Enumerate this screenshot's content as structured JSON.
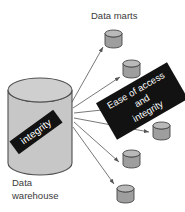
{
  "labels": {
    "data_marts": "Data marts",
    "warehouse_line1": "Data",
    "warehouse_line2": "warehouse"
  },
  "banners": {
    "warehouse_banner": "integrity",
    "flow_banner_line1": "Ease of access",
    "flow_banner_line2": "and",
    "flow_banner_line3": "integrity"
  },
  "colors": {
    "background": "#ffffff",
    "banner_bg": "#121212",
    "banner_text": "#ffffff",
    "warehouse_cylinder_fill": "#c7c7c7",
    "warehouse_cylinder_top": "#cfcfcf",
    "mart_cylinder_fill": "#9e9e9e",
    "mart_cylinder_top": "#b9b9b9",
    "outline": "#454545",
    "arrow": "#555555",
    "label_text": "#3a3a3a"
  }
}
